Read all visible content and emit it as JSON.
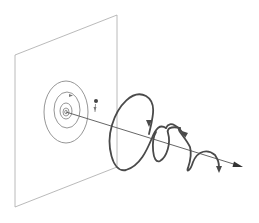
{
  "diagram": {
    "title": "",
    "colors": {
      "plane": "#a8a8a8",
      "spiral": "#8a8a8a",
      "axis": "#555555",
      "helix": "#4a4a4a",
      "dot": "#444444"
    },
    "labels": []
  }
}
